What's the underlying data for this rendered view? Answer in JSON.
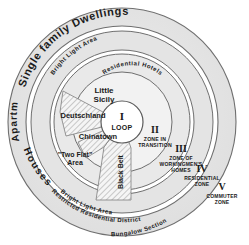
{
  "diagram": {
    "colors": {
      "ring_fill": "#e3e3e3",
      "ring_fill_light": "#ececec",
      "center_fill": "#ffffff",
      "stroke": "#6b6b6b",
      "text": "#1a1a1a",
      "hatch": "#8a8a8a"
    },
    "zones": [
      {
        "roman": "I",
        "name": "LOOP"
      },
      {
        "roman": "II",
        "name_line1": "ZONE IN",
        "name_line2": "TRANSITION"
      },
      {
        "roman": "III",
        "name_line1": "ZONE OF",
        "name_line2": "WORKINGMEN'S",
        "name_line3": "HOMES"
      },
      {
        "roman": "IV",
        "name_line1": "RESIDENTIAL",
        "name_line2": "ZONE"
      },
      {
        "roman": "V",
        "name_line1": "COMMUTER",
        "name_line2": "ZONE"
      }
    ],
    "districts": [
      {
        "id": "little-sicily",
        "line1": "Little",
        "line2": "Sicily"
      },
      {
        "id": "deutschland",
        "line1": "Deutschland"
      },
      {
        "id": "chinatown",
        "line1": "Chinatown"
      },
      {
        "id": "two-flat-area",
        "line1": "\"Two Flat\"",
        "line2": "Area"
      },
      {
        "id": "black-belt",
        "line1": "Black Belt"
      }
    ],
    "curved_labels": [
      {
        "id": "single-family-dwellings",
        "text": "Single family Dwellings"
      },
      {
        "id": "apartment-houses",
        "text": "Apartment Houses"
      },
      {
        "id": "bright-light-area-top",
        "text": "Bright Light Area"
      },
      {
        "id": "bright-light-area-bottom",
        "text": "Bright Light Area"
      },
      {
        "id": "restricted-residential-district",
        "text": "Restricted Residential District"
      },
      {
        "id": "bungalow-section",
        "text": "Bungalow Section"
      },
      {
        "id": "residential-hotels",
        "text": "Residential Hotels"
      }
    ]
  }
}
